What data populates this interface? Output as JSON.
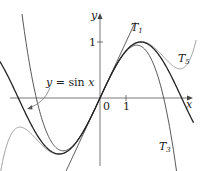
{
  "figure": {
    "axes": {
      "x_label": "x",
      "y_label": "y",
      "origin_label": "0",
      "x_tick_label": "1",
      "y_tick_label": "1"
    },
    "curves": [
      {
        "name": "sin",
        "label": "y = sin x",
        "color": "#222222",
        "width": 1.6
      },
      {
        "name": "T1",
        "label": "T",
        "subscript": "1",
        "color": "#333333",
        "width": 0.9
      },
      {
        "name": "T3",
        "label": "T",
        "subscript": "3",
        "color": "#444444",
        "width": 0.9
      },
      {
        "name": "T5",
        "label": "T",
        "subscript": "5",
        "color": "#999999",
        "width": 0.9
      }
    ],
    "annotation": {
      "text": "y = sin x"
    }
  },
  "chart_data": {
    "type": "line",
    "title": "",
    "xlabel": "x",
    "ylabel": "y",
    "series": [
      {
        "name": "y = sin x",
        "formula": "sin(x)"
      },
      {
        "name": "T1",
        "formula": "x"
      },
      {
        "name": "T3",
        "formula": "x - x^3/6"
      },
      {
        "name": "T5",
        "formula": "x - x^3/6 + x^5/120"
      }
    ],
    "ticks": {
      "x": [
        0,
        1
      ],
      "y": [
        1
      ]
    },
    "xlim": [
      -3.8,
      3.6
    ],
    "ylim": [
      -1.7,
      1.8
    ],
    "grid": false,
    "legend": "inline labels"
  }
}
